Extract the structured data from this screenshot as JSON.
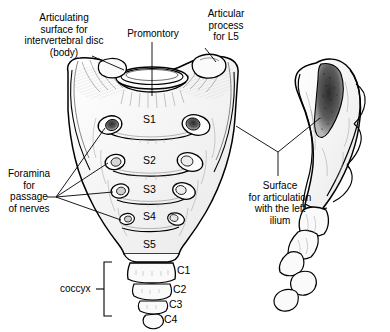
{
  "figure": {
    "background_color": "#ffffff",
    "line_color": "#000000",
    "shade_color": "#4a4a4a"
  },
  "callouts": {
    "articulating_surface": {
      "id": "articulating-surface-label",
      "lines": [
        "Articulating",
        "surface for",
        "intervertebral disc",
        "(body)"
      ],
      "text": "Articulating\nsurface for\nintervertebral disc\n(body)",
      "x": 8,
      "y": 12
    },
    "promontory": {
      "id": "promontory-label",
      "text": "Promontory",
      "x": 124,
      "y": 28
    },
    "articular_process": {
      "id": "articular-process-label",
      "lines": [
        "Articular",
        "process",
        "for L5"
      ],
      "text": "Articular\nprocess\nfor L5",
      "x": 200,
      "y": 8
    },
    "foramina": {
      "id": "foramina-label",
      "lines": [
        "Foramina",
        "for",
        "passage",
        "of nerves"
      ],
      "text": "Foramina\nfor\npassage\nof nerves",
      "x": 6,
      "y": 168
    },
    "surface_articulation": {
      "id": "surface-articulation-label",
      "lines": [
        "Surface",
        "for articulation",
        "with the left",
        "ilium"
      ],
      "text": "Surface\nfor articulation\nwith the left\nilium",
      "x": 246,
      "y": 180
    }
  },
  "sacral_segments": [
    {
      "label": "S1",
      "x": 143,
      "y": 114
    },
    {
      "label": "S2",
      "x": 143,
      "y": 155
    },
    {
      "label": "S3",
      "x": 143,
      "y": 184
    },
    {
      "label": "S4",
      "x": 143,
      "y": 211
    },
    {
      "label": "S5",
      "x": 143,
      "y": 239
    }
  ],
  "coccygeal_segments": [
    {
      "label": "C1",
      "x": 170,
      "y": 266
    },
    {
      "label": "C2",
      "x": 170,
      "y": 285
    },
    {
      "label": "C3",
      "x": 166,
      "y": 300
    },
    {
      "label": "C4",
      "x": 163,
      "y": 314
    }
  ],
  "coccyx_bracket": {
    "label": "coccyx",
    "label_x": 65,
    "label_y": 284
  }
}
